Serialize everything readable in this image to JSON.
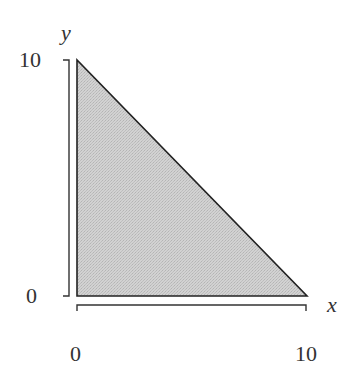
{
  "diagram": {
    "type": "shaded-region",
    "region": {
      "vertices": [
        [
          0,
          0
        ],
        [
          0,
          10
        ],
        [
          10,
          0
        ]
      ],
      "fill_color": "#cbcbcb",
      "stroke_color": "#222222"
    },
    "axes": {
      "x": {
        "label": "x",
        "min": 0,
        "max": 10,
        "tick_labels": [
          "0",
          "10"
        ]
      },
      "y": {
        "label": "y",
        "min": 0,
        "max": 10,
        "tick_labels": [
          "0",
          "10"
        ]
      }
    }
  },
  "labels": {
    "x_axis": "x",
    "y_axis": "y",
    "x_min": "0",
    "x_max": "10",
    "y_min": "0",
    "y_max": "10"
  }
}
